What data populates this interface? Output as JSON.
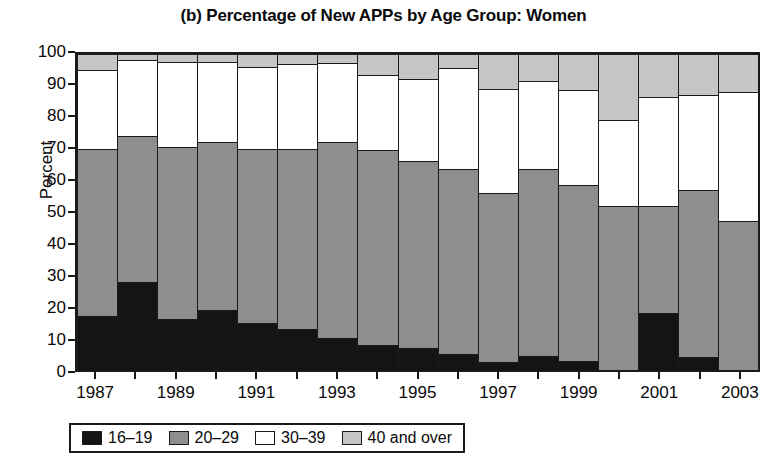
{
  "chart_data": {
    "type": "bar",
    "subtype": "stacked-percentage",
    "title": "(b) Percentage of New APPs by Age Group: Women",
    "xlabel": "",
    "ylabel": "Percent",
    "ylim": [
      0,
      100
    ],
    "yticks": [
      0,
      10,
      20,
      30,
      40,
      50,
      60,
      70,
      80,
      90,
      100
    ],
    "xtick_labels": [
      "1987",
      "1989",
      "1991",
      "1993",
      "1995",
      "1997",
      "1999",
      "2001",
      "2003"
    ],
    "grid": false,
    "legend_position": "bottom",
    "categories": [
      "1987",
      "1988",
      "1989",
      "1990",
      "1991",
      "1992",
      "1993",
      "1994",
      "1995",
      "1996",
      "1997",
      "1998",
      "1999",
      "2000",
      "2001",
      "2002",
      "2003"
    ],
    "series": [
      {
        "name": "16–19",
        "color": "#141414",
        "values": [
          17,
          28,
          16,
          19,
          15,
          13,
          10,
          8,
          7,
          5,
          2.5,
          4.5,
          3,
          0,
          18,
          4,
          0
        ]
      },
      {
        "name": "20–29",
        "color": "#8e8e8e",
        "values": [
          53,
          46,
          54.5,
          53,
          55,
          57,
          62,
          61.5,
          59,
          58.5,
          53.5,
          59,
          55.5,
          52,
          34,
          53,
          47
        ]
      },
      {
        "name": "30–39",
        "color": "#ffffff",
        "values": [
          25,
          24,
          27,
          25.5,
          26,
          27,
          25,
          24,
          26,
          32,
          33,
          28,
          30,
          27,
          34.5,
          30,
          41
        ]
      },
      {
        "name": "40 and over",
        "color": "#c6c6c6",
        "values": [
          5,
          2,
          2.5,
          2.5,
          4,
          3,
          3,
          6.5,
          8,
          4.5,
          11,
          8.5,
          11.5,
          21,
          13.5,
          13,
          12
        ]
      }
    ],
    "stack_tops": {
      "16–19": [
        17,
        28,
        16,
        19,
        15,
        13,
        10,
        8,
        7,
        5,
        2.5,
        4.5,
        3,
        0,
        18,
        4,
        0
      ],
      "20–29": [
        70,
        74,
        70.5,
        72,
        70,
        70,
        72,
        69.5,
        66,
        63.5,
        56,
        63.5,
        58.5,
        52,
        52,
        57,
        47
      ],
      "30–39": [
        95,
        98,
        97.5,
        97.5,
        96,
        97,
        97,
        93.5,
        92,
        95.5,
        89,
        91.5,
        88.5,
        79,
        86.5,
        87,
        88
      ],
      "40 and over": [
        100,
        100,
        100,
        100,
        100,
        100,
        100,
        100,
        100,
        100,
        100,
        100,
        100,
        100,
        100,
        100,
        100
      ]
    }
  },
  "legend": {
    "items": [
      {
        "label": "16–19",
        "color": "#141414"
      },
      {
        "label": "20–29",
        "color": "#8e8e8e"
      },
      {
        "label": "30–39",
        "color": "#ffffff"
      },
      {
        "label": "40 and over",
        "color": "#c6c6c6"
      }
    ]
  }
}
